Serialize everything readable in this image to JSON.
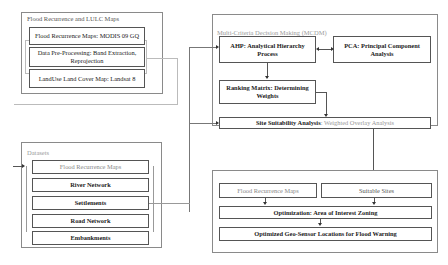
{
  "groups": {
    "flood_lulc": {
      "title": "Flood Recurrence and LULC  Maps",
      "boxes": [
        {
          "label": "Flood Recurrence Maps: MODIS 09 GQ"
        },
        {
          "label": "Data Pre-Processing: Band Extraction, Reprojection"
        },
        {
          "label": "LandUse Land Cover Map: Landsat 8"
        }
      ]
    },
    "mcdm": {
      "title": "Multi-Criteria Decision Making (MCDM)",
      "ahp": "AHP: Analytical Hierarchy Process",
      "pca": "PCA: Principal Component Analysis",
      "ranking": "Ranking Matrix: Determining Weights",
      "site_bold": "Site Suitability Analysis",
      "site_light": ": Weighted Overlay Analysis"
    },
    "datasets": {
      "title": "Datasets",
      "boxes": [
        {
          "label": "Flood Recurrence Maps"
        },
        {
          "label": "River Network"
        },
        {
          "label": "Settlements"
        },
        {
          "label": "Road Network"
        },
        {
          "label": "Embankments"
        }
      ]
    },
    "optimization": {
      "flood_maps": "Flood Recurrence Maps",
      "suitable_sites": "Suitable Sites",
      "zoning": "Optimization: Area of Interest Zoning",
      "result": "Optimized Geo-Sensor Locations for Flood Warning"
    }
  },
  "colors": {
    "border": "#555555",
    "group_border": "#8a8a8a",
    "muted_text": "#999999"
  }
}
